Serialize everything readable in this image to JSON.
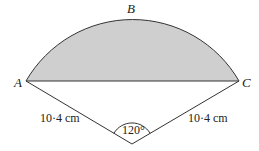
{
  "diagram": {
    "points": {
      "A": "A",
      "B": "B",
      "C": "C"
    },
    "side_left": "10·4 cm",
    "side_right": "10·4 cm",
    "angle": "120°",
    "colors": {
      "segment_fill": "#cfcfcf",
      "stroke": "#333333"
    }
  }
}
